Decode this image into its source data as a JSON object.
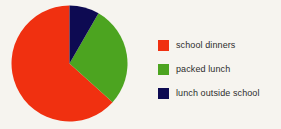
{
  "chart_data": {
    "type": "pie",
    "title": "",
    "subtitle": "",
    "xlabel": "",
    "ylabel": "",
    "grid": false,
    "legend_position": "right",
    "start_angle_deg": 0,
    "direction": "clockwise",
    "categories": [
      "school dinners",
      "packed lunch",
      "lunch outside school"
    ],
    "values": [
      63,
      29,
      8
    ],
    "value_unit": "percent",
    "colors": [
      "#f03010",
      "#4ca420",
      "#0d0a52"
    ],
    "slices": [
      {
        "label": "school dinners",
        "value": 63,
        "color": "#f03010",
        "start_deg": 132,
        "end_deg": 360
      },
      {
        "label": "packed lunch",
        "value": 29,
        "color": "#4ca420",
        "start_deg": 30,
        "end_deg": 132
      },
      {
        "label": "lunch outside school",
        "value": 8,
        "color": "#0d0a52",
        "start_deg": 0,
        "end_deg": 30
      }
    ]
  },
  "legend": {
    "items": [
      {
        "label": "school dinners",
        "color": "#f03010"
      },
      {
        "label": "packed lunch",
        "color": "#4ca420"
      },
      {
        "label": "lunch outside school",
        "color": "#0d0a52"
      }
    ]
  },
  "canvas": {
    "background": "#f6f4ef"
  }
}
